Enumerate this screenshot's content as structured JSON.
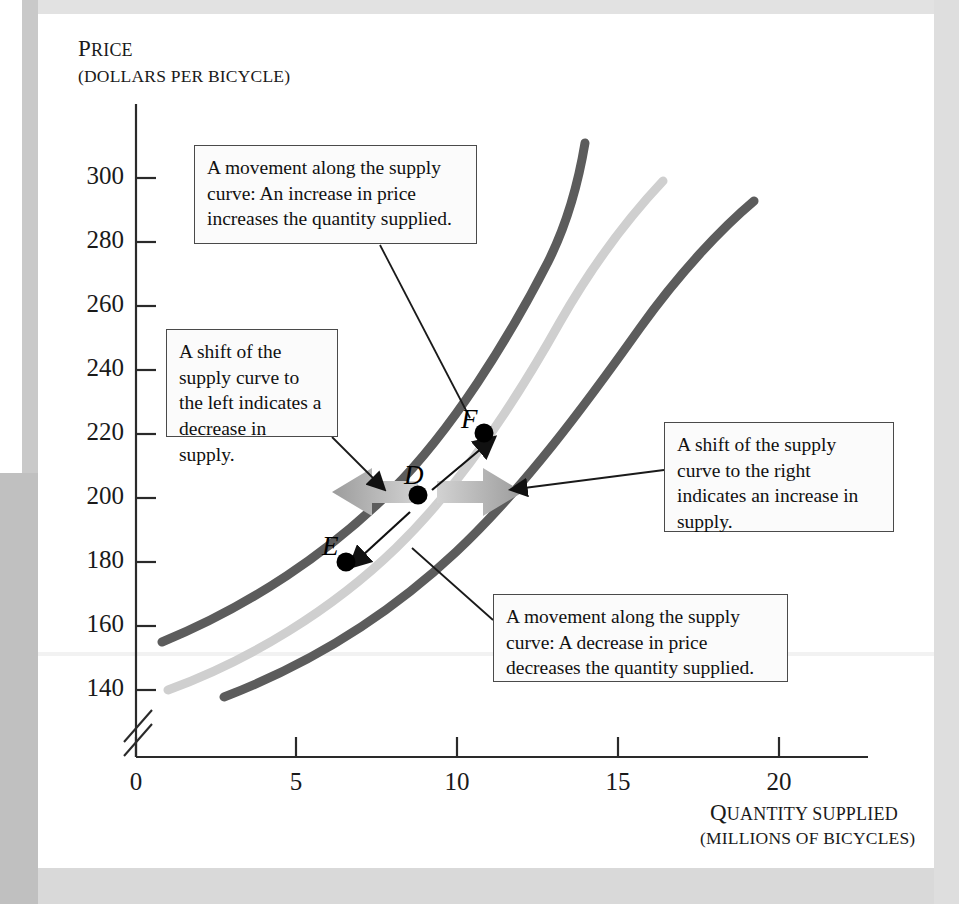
{
  "figure": {
    "kind": "economics-supply-curve-diagram",
    "background_color": "#ffffff",
    "frame_color": "#c9c9c9"
  },
  "axes": {
    "y": {
      "title_first": "P",
      "title_rest": "RICE",
      "subtitle": "(DOLLARS PER BICYCLE)",
      "ticks": [
        140,
        160,
        180,
        200,
        220,
        240,
        260,
        280,
        300
      ],
      "has_axis_break": true
    },
    "x": {
      "title_first": "Q",
      "title_rest": "UANTITY SUPPLIED",
      "subtitle": "(MILLIONS OF BICYCLES)",
      "ticks": [
        0,
        5,
        10,
        15,
        20
      ]
    }
  },
  "callouts": {
    "movement_up": "A movement along the supply curve: An increase in price increases the quantity supplied.",
    "shift_left": "A shift of the supply curve to the left indicates a decrease in supply.",
    "shift_right": "A shift of the supply curve to the right indicates an increase in supply.",
    "movement_down": "A movement along the supply curve: A decrease in price decreases the quantity supplied."
  },
  "points": {
    "D": {
      "label": "D",
      "quantity": 9.0,
      "price": 200
    },
    "E": {
      "label": "E",
      "quantity": 6.6,
      "price": 181
    },
    "F": {
      "label": "F",
      "quantity": 11.2,
      "price": 220
    }
  },
  "chart_data": {
    "type": "line",
    "title": "",
    "xlabel": "Quantity supplied (millions of bicycles)",
    "ylabel": "Price (dollars per bicycle)",
    "xlim": [
      0,
      22.5
    ],
    "ylim": [
      133,
      318
    ],
    "xticks": [
      0,
      5,
      10,
      15,
      20
    ],
    "yticks": [
      140,
      160,
      180,
      200,
      220,
      240,
      260,
      280,
      300
    ],
    "grid": false,
    "legend": "none",
    "series": [
      {
        "name": "S3 (supply shifted left - decrease in supply)",
        "color": "#5c5c5c",
        "style": "thick-curve",
        "x": [
          0.8,
          2.5,
          4.5,
          6.5,
          8.5,
          10.5,
          12.3,
          13.8,
          14.2
        ],
        "y": [
          155,
          166,
          180,
          196,
          214,
          238,
          268,
          300,
          313
        ]
      },
      {
        "name": "S (original supply curve)",
        "color": "#cfcfcf",
        "style": "thick-curve",
        "x": [
          1.0,
          3.0,
          5.0,
          7.0,
          9.0,
          11.2,
          13.5,
          15.5,
          16.9
        ],
        "y": [
          140,
          151,
          164,
          182,
          200,
          220,
          246,
          273,
          300
        ]
      },
      {
        "name": "S2 (supply shifted right - increase in supply)",
        "color": "#5c5c5c",
        "style": "thick-curve",
        "x": [
          2.7,
          5.0,
          7.5,
          10.0,
          12.5,
          15.0,
          17.3,
          19.1,
          20.0
        ],
        "y": [
          138,
          150,
          164,
          181,
          200,
          223,
          250,
          273,
          288
        ]
      }
    ],
    "annotated_points": [
      {
        "label": "D",
        "x": 9.0,
        "y": 200
      },
      {
        "label": "E",
        "x": 6.6,
        "y": 181
      },
      {
        "label": "F",
        "x": 11.2,
        "y": 220
      }
    ],
    "shift_arrows": [
      {
        "name": "shift-left-arrow",
        "direction": "left",
        "color": "#a8a8a8",
        "at_price": 200
      },
      {
        "name": "shift-right-arrow",
        "direction": "right",
        "color": "#a8a8a8",
        "at_price": 200
      }
    ]
  }
}
